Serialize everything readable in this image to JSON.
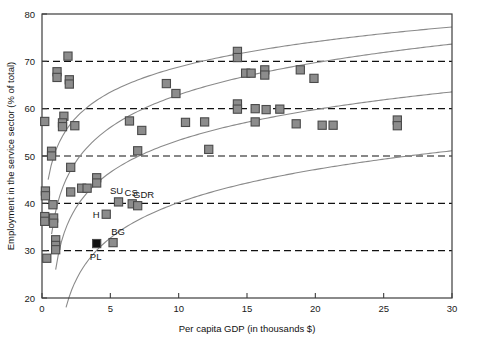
{
  "chart_data": {
    "type": "scatter",
    "title": "",
    "xlabel": "Per capita GDP (in thousands $)",
    "ylabel": "Employment in the service sector (% of total)",
    "xlim": [
      0,
      30
    ],
    "ylim": [
      20,
      80
    ],
    "xticks": [
      0,
      5,
      10,
      15,
      20,
      25,
      30
    ],
    "yticks": [
      20,
      30,
      40,
      50,
      60,
      70,
      80
    ],
    "xtick_labels": [
      "0",
      "5",
      "10",
      "15",
      "20",
      "25",
      "30"
    ],
    "ytick_labels": [
      "20",
      "30",
      "40",
      "50",
      "60",
      "70",
      "80"
    ],
    "grid": "horizontal dashed at 30, 40, 50, 60, 70",
    "gridlines_y": [
      30,
      40,
      50,
      60,
      70
    ],
    "legend": "none",
    "marker_color": "#8c8c8c",
    "marker_edge_color": "#4a4a4a",
    "highlight_color": "#111111",
    "trend_color": "#8a8a8a",
    "points": [
      {
        "x": 0.2,
        "y": 57.3,
        "label": ""
      },
      {
        "x": 1.1,
        "y": 67.8,
        "label": ""
      },
      {
        "x": 1.1,
        "y": 66.6,
        "label": ""
      },
      {
        "x": 1.9,
        "y": 71.1,
        "label": ""
      },
      {
        "x": 2.0,
        "y": 66.1,
        "label": ""
      },
      {
        "x": 2.0,
        "y": 65.2,
        "label": ""
      },
      {
        "x": 1.6,
        "y": 58.4,
        "label": ""
      },
      {
        "x": 1.5,
        "y": 57.0,
        "label": ""
      },
      {
        "x": 1.5,
        "y": 56.2,
        "label": ""
      },
      {
        "x": 2.4,
        "y": 56.4,
        "label": ""
      },
      {
        "x": 0.7,
        "y": 51.0,
        "label": ""
      },
      {
        "x": 0.7,
        "y": 50.0,
        "label": ""
      },
      {
        "x": 0.25,
        "y": 42.6,
        "label": ""
      },
      {
        "x": 0.25,
        "y": 41.6,
        "label": ""
      },
      {
        "x": 0.8,
        "y": 39.7,
        "label": ""
      },
      {
        "x": 0.2,
        "y": 37.2,
        "label": ""
      },
      {
        "x": 0.2,
        "y": 36.2,
        "label": ""
      },
      {
        "x": 0.85,
        "y": 36.9,
        "label": ""
      },
      {
        "x": 0.85,
        "y": 35.8,
        "label": ""
      },
      {
        "x": 1.0,
        "y": 32.3,
        "label": ""
      },
      {
        "x": 1.0,
        "y": 31.1,
        "label": ""
      },
      {
        "x": 1.0,
        "y": 30.2,
        "label": ""
      },
      {
        "x": 0.35,
        "y": 28.4,
        "label": ""
      },
      {
        "x": 2.1,
        "y": 47.6,
        "label": ""
      },
      {
        "x": 2.1,
        "y": 42.4,
        "label": ""
      },
      {
        "x": 2.9,
        "y": 43.2,
        "label": ""
      },
      {
        "x": 3.3,
        "y": 43.2,
        "label": ""
      },
      {
        "x": 4.0,
        "y": 45.4,
        "label": ""
      },
      {
        "x": 4.0,
        "y": 44.3,
        "label": ""
      },
      {
        "x": 4.0,
        "y": 31.5,
        "label": "PL",
        "highlight": true
      },
      {
        "x": 5.2,
        "y": 31.7,
        "label": "BG"
      },
      {
        "x": 4.7,
        "y": 37.7,
        "label": "H"
      },
      {
        "x": 5.6,
        "y": 40.3,
        "label": "SU"
      },
      {
        "x": 6.6,
        "y": 39.9,
        "label": "CS"
      },
      {
        "x": 7.0,
        "y": 39.5,
        "label": "GDR"
      },
      {
        "x": 7.0,
        "y": 51.1,
        "label": ""
      },
      {
        "x": 6.4,
        "y": 57.4,
        "label": ""
      },
      {
        "x": 7.3,
        "y": 55.4,
        "label": ""
      },
      {
        "x": 9.1,
        "y": 65.3,
        "label": ""
      },
      {
        "x": 9.8,
        "y": 63.2,
        "label": ""
      },
      {
        "x": 10.5,
        "y": 57.1,
        "label": ""
      },
      {
        "x": 11.9,
        "y": 57.2,
        "label": ""
      },
      {
        "x": 12.2,
        "y": 51.4,
        "label": ""
      },
      {
        "x": 14.3,
        "y": 72.1,
        "label": ""
      },
      {
        "x": 14.3,
        "y": 70.8,
        "label": ""
      },
      {
        "x": 14.9,
        "y": 67.5,
        "label": ""
      },
      {
        "x": 14.3,
        "y": 61.0,
        "label": ""
      },
      {
        "x": 14.3,
        "y": 59.9,
        "label": ""
      },
      {
        "x": 15.6,
        "y": 57.2,
        "label": ""
      },
      {
        "x": 15.3,
        "y": 67.5,
        "label": ""
      },
      {
        "x": 16.3,
        "y": 68.2,
        "label": ""
      },
      {
        "x": 16.3,
        "y": 67.1,
        "label": ""
      },
      {
        "x": 15.6,
        "y": 60.0,
        "label": ""
      },
      {
        "x": 16.4,
        "y": 59.8,
        "label": ""
      },
      {
        "x": 17.4,
        "y": 59.9,
        "label": ""
      },
      {
        "x": 18.9,
        "y": 68.2,
        "label": ""
      },
      {
        "x": 18.6,
        "y": 56.8,
        "label": ""
      },
      {
        "x": 19.9,
        "y": 66.4,
        "label": ""
      },
      {
        "x": 20.5,
        "y": 56.5,
        "label": ""
      },
      {
        "x": 21.3,
        "y": 56.5,
        "label": ""
      },
      {
        "x": 26.0,
        "y": 57.6,
        "label": ""
      },
      {
        "x": 26.0,
        "y": 56.4,
        "label": ""
      }
    ],
    "trend_curves": [
      {
        "name": "curve-upper",
        "a": 45.0,
        "b": 7.7,
        "x0": 0.45
      },
      {
        "name": "curve-upper-mid",
        "a": 33.5,
        "b": 9.6,
        "x0": 0.7
      },
      {
        "name": "curve-lower-mid",
        "a": 26.0,
        "b": 9.0,
        "x0": 1.0
      },
      {
        "name": "curve-lower",
        "a": 12.0,
        "b": 9.4,
        "x0": 1.35
      }
    ]
  }
}
